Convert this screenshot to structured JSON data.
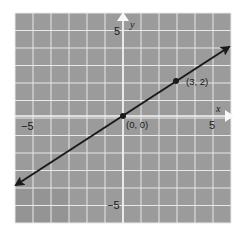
{
  "chart_data": {
    "type": "line",
    "title": "",
    "xlabel": "x",
    "ylabel": "y",
    "xlim": [
      -6,
      6
    ],
    "ylim": [
      -6,
      6
    ],
    "grid": true,
    "x_tick_labels": [
      {
        "value": -5,
        "label": "−5"
      },
      {
        "value": 5,
        "label": "5"
      }
    ],
    "y_tick_labels": [
      {
        "value": 5,
        "label": "5"
      },
      {
        "value": -5,
        "label": "−5"
      }
    ],
    "series": [
      {
        "name": "line y = (2/3)x",
        "x": [
          -5.94,
          0,
          3,
          5.9
        ],
        "y": [
          -3.96,
          0,
          2,
          3.93
        ],
        "arrows_both_ends": true,
        "color": "#1a1a1a"
      }
    ],
    "points": [
      {
        "x": 0,
        "y": 0,
        "label": "(0, 0)"
      },
      {
        "x": 3,
        "y": 2,
        "label": "(3, 2)"
      }
    ],
    "legend": null
  },
  "colors": {
    "cell": "#9b9b9b",
    "cell_dark": "#939393",
    "gridline": "#e8e8e8",
    "axis": "#f4f4f4",
    "line": "#1a1a1a"
  },
  "labels": {
    "x_axis_name": "x",
    "y_axis_name": "y",
    "x_pos_tick": "5",
    "x_neg_tick": "−5",
    "y_pos_tick": "5",
    "y_neg_tick": "−5",
    "origin_label": "(0, 0)",
    "point_label": "(3, 2)"
  }
}
